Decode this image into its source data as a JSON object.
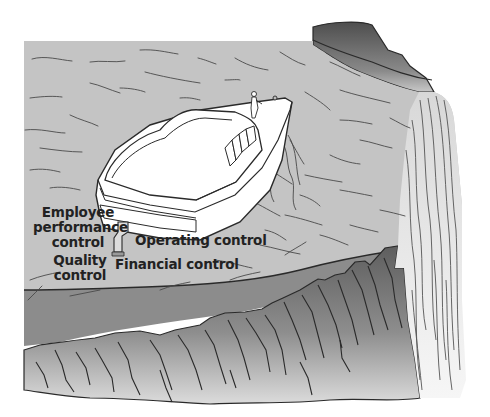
{
  "figure": {
    "colors": {
      "background": "#ffffff",
      "water": "#c4c4c4",
      "water_lines": "#4a4a4a",
      "shadow_band": "#8c8c8c",
      "rock_dark": "#5e5e5e",
      "rock_light": "#d6d6d6",
      "boat": "#ffffff",
      "outline": "#2a2a2a",
      "waterfall": "#ececec",
      "text": "#222222"
    },
    "labels": {
      "employee_performance_control": [
        "Employee",
        "performance",
        "control"
      ],
      "operating_control": "Operating control",
      "quality_control": [
        "Quality",
        "control"
      ],
      "financial_control": "Financial control"
    }
  }
}
